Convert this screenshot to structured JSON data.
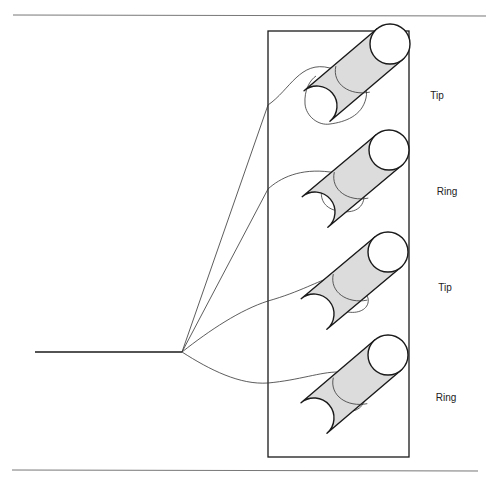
{
  "diagram": {
    "title": "",
    "colors": {
      "stroke": "#1a1a1a",
      "wire": "#333333",
      "cylinder_fill": "#dcdcdc",
      "cylinder_end_fill": "#ffffff",
      "rule": "#777777"
    },
    "rules": [
      {
        "name": "top-rule",
        "x1": 13,
        "y1": 15,
        "x2": 486,
        "y2": 16
      },
      {
        "name": "bottom-rule",
        "x1": 12,
        "y1": 470,
        "x2": 478,
        "y2": 471
      }
    ],
    "enclosure": {
      "x": 268,
      "y": 31,
      "width": 141,
      "height": 426
    },
    "lead": {
      "x1": 35,
      "y1": 352,
      "x2": 182,
      "y2": 352
    },
    "junction": {
      "x": 182,
      "y": 352
    },
    "terminals": [
      {
        "label": "Tip",
        "label_x": 437,
        "label_y": 95,
        "end_cx": 390,
        "end_cy": 44,
        "r": 20,
        "tail_cx": 317,
        "tail_cy": 106
      },
      {
        "label": "Ring",
        "label_x": 447,
        "label_y": 191,
        "end_cx": 389,
        "end_cy": 150,
        "r": 20,
        "tail_cx": 315,
        "tail_cy": 212
      },
      {
        "label": "Tip",
        "label_x": 445,
        "label_y": 287,
        "end_cx": 388,
        "end_cy": 252,
        "r": 20,
        "tail_cx": 314,
        "tail_cy": 314
      },
      {
        "label": "Ring",
        "label_x": 446,
        "label_y": 397,
        "end_cx": 388,
        "end_cy": 355,
        "r": 20,
        "tail_cx": 314,
        "tail_cy": 418
      }
    ],
    "wires": [
      {
        "name": "wire-1",
        "d": "M182,352 L268,105 C290,90 300,60 330,68 C352,72 370,80 366,98 C362,116 345,122 330,124 C318,126 306,116 305,104 C304,90 310,80 316,76"
      },
      {
        "name": "wire-2",
        "d": "M182,352 L268,189 C280,178 300,168 330,172 C352,174 366,184 364,198 C362,212 348,214 334,210 C322,206 320,196 322,188"
      },
      {
        "name": "wire-3",
        "d": "M182,352 C210,330 240,310 268,301 C300,292 320,280 330,278 C345,276 362,284 368,298 C370,308 360,314 348,312 C338,310 326,296 324,288"
      },
      {
        "name": "wire-4",
        "d": "M182,352 C210,370 240,385 268,383 C300,380 320,372 338,372 C352,372 368,388 364,402 C360,412 346,414 336,410 C326,404 324,394 326,386"
      }
    ]
  }
}
